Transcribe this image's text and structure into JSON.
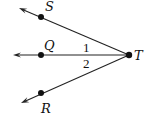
{
  "diagram": {
    "type": "geometry-angles",
    "vertex": {
      "label": "T",
      "x": 129,
      "y": 55
    },
    "rays": [
      {
        "name": "ray-TS",
        "point": {
          "label": "S",
          "x": 41,
          "y": 17
        },
        "arrow_tip": {
          "x": 19,
          "y": 8
        },
        "label_pos": {
          "x": 45,
          "y": 11
        }
      },
      {
        "name": "ray-TQ",
        "point": {
          "label": "Q",
          "x": 41,
          "y": 55
        },
        "arrow_tip": {
          "x": 13,
          "y": 55
        },
        "label_pos": {
          "x": 44,
          "y": 50
        }
      },
      {
        "name": "ray-TR",
        "point": {
          "label": "R",
          "x": 41,
          "y": 93
        },
        "arrow_tip": {
          "x": 21,
          "y": 103
        },
        "label_pos": {
          "x": 41,
          "y": 113
        }
      }
    ],
    "angles": [
      {
        "label": "1",
        "between": [
          "TS",
          "TQ"
        ],
        "x": 83,
        "y": 52
      },
      {
        "label": "2",
        "between": [
          "TQ",
          "TR"
        ],
        "x": 83,
        "y": 68
      }
    ],
    "colors": {
      "stroke": "#222222",
      "point": "#111111",
      "background": "#ffffff"
    }
  }
}
